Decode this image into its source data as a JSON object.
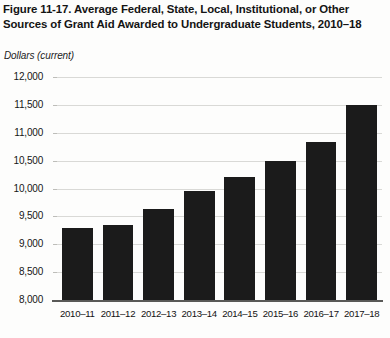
{
  "figure": {
    "title": "Figure 11-17. Average Federal, State, Local, Institutional, or Other Sources of Grant Aid Awarded to Undergraduate Students, 2010–18",
    "axis_unit": "Dollars (current)",
    "bar_color": "#1b1b1b",
    "grid_color": "#d9d9d6",
    "background": "#fdfdfc"
  },
  "chart_data": {
    "type": "bar",
    "title": "Figure 11-17. Average Federal, State, Local, Institutional, or Other Sources of Grant Aid Awarded to Undergraduate Students, 2010–18",
    "xlabel": "",
    "ylabel": "Dollars (current)",
    "categories": [
      "2010–11",
      "2011–12",
      "2012–13",
      "2013–14",
      "2014–15",
      "2015–16",
      "2016–17",
      "2017–18"
    ],
    "values": [
      9300,
      9350,
      9640,
      9950,
      10200,
      10500,
      10830,
      11500
    ],
    "ylim": [
      8000,
      12000
    ],
    "yticks": [
      8000,
      8500,
      9000,
      9500,
      10000,
      10500,
      11000,
      11500,
      12000
    ],
    "ytick_labels": [
      "8,000",
      "8,500",
      "9,000",
      "9,500",
      "10,000",
      "10,500",
      "11,000",
      "11,500",
      "12,000"
    ],
    "grid": true,
    "legend": "none",
    "series": [
      {
        "name": "Average grant aid",
        "values": [
          9300,
          9350,
          9640,
          9950,
          10200,
          10500,
          10830,
          11500
        ]
      }
    ]
  }
}
